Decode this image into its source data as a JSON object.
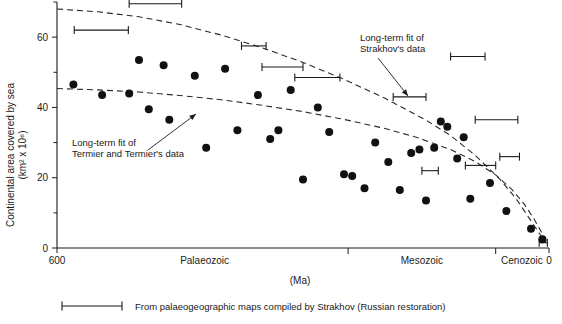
{
  "chart_data": {
    "type": "scatter",
    "title": "",
    "xlabel": "(Ma)",
    "ylabel": "Continental area covered by sea (km² x 10⁶)",
    "ylabel_line1": "Continental area covered by sea",
    "ylabel_line2": "(km² x 10⁶)",
    "xlim": [
      600,
      0
    ],
    "ylim": [
      0,
      70
    ],
    "x_inverted": true,
    "grid": false,
    "legend_position": "below-axis",
    "y_ticks": [
      0,
      20,
      40,
      60
    ],
    "y_tick_labels": [
      "0",
      "20",
      "40",
      "60"
    ],
    "y_minor_ticks": [
      10,
      30,
      50,
      70
    ],
    "x_ticks": [
      600,
      0
    ],
    "x_tick_labels": [
      "600",
      "0"
    ],
    "era_boundaries": [
      245,
      65
    ],
    "era_labels": [
      {
        "name": "Palaeozoic",
        "center_ma": 420
      },
      {
        "name": "Mesozoic",
        "center_ma": 155
      },
      {
        "name": "Cenozoic",
        "center_ma": 33
      }
    ],
    "points": [
      {
        "x": 580,
        "y": 46.5
      },
      {
        "x": 545,
        "y": 43.5
      },
      {
        "x": 512,
        "y": 44.0
      },
      {
        "x": 500,
        "y": 53.5
      },
      {
        "x": 488,
        "y": 39.5
      },
      {
        "x": 470,
        "y": 52.0
      },
      {
        "x": 463,
        "y": 36.5
      },
      {
        "x": 432,
        "y": 49.0
      },
      {
        "x": 418,
        "y": 28.5
      },
      {
        "x": 395,
        "y": 51.0
      },
      {
        "x": 380,
        "y": 33.5
      },
      {
        "x": 355,
        "y": 43.5
      },
      {
        "x": 340,
        "y": 31.0
      },
      {
        "x": 330,
        "y": 33.5
      },
      {
        "x": 315,
        "y": 45.0
      },
      {
        "x": 300,
        "y": 19.5
      },
      {
        "x": 282,
        "y": 40.0
      },
      {
        "x": 268,
        "y": 33.0
      },
      {
        "x": 250,
        "y": 21.0
      },
      {
        "x": 240,
        "y": 20.5
      },
      {
        "x": 225,
        "y": 17.0
      },
      {
        "x": 212,
        "y": 30.0
      },
      {
        "x": 196,
        "y": 24.5
      },
      {
        "x": 182,
        "y": 16.5
      },
      {
        "x": 168,
        "y": 27.0
      },
      {
        "x": 158,
        "y": 28.0
      },
      {
        "x": 150,
        "y": 13.5
      },
      {
        "x": 140,
        "y": 28.5
      },
      {
        "x": 132,
        "y": 36.0
      },
      {
        "x": 124,
        "y": 34.5
      },
      {
        "x": 112,
        "y": 25.5
      },
      {
        "x": 104,
        "y": 31.5
      },
      {
        "x": 96,
        "y": 14.0
      },
      {
        "x": 72,
        "y": 18.5
      },
      {
        "x": 52,
        "y": 10.5
      },
      {
        "x": 22,
        "y": 5.5
      },
      {
        "x": 8,
        "y": 2.5
      }
    ],
    "series": [
      {
        "name": "Long-term fit of Strakhov's data",
        "type": "line",
        "style": "dashed",
        "points": [
          {
            "x": 600,
            "y": 68.0
          },
          {
            "x": 550,
            "y": 67.2
          },
          {
            "x": 500,
            "y": 65.8
          },
          {
            "x": 450,
            "y": 63.6
          },
          {
            "x": 400,
            "y": 60.6
          },
          {
            "x": 350,
            "y": 57.0
          },
          {
            "x": 300,
            "y": 52.8
          },
          {
            "x": 250,
            "y": 48.0
          },
          {
            "x": 200,
            "y": 42.6
          },
          {
            "x": 150,
            "y": 36.4
          },
          {
            "x": 120,
            "y": 32.0
          },
          {
            "x": 90,
            "y": 26.4
          },
          {
            "x": 60,
            "y": 19.6
          },
          {
            "x": 40,
            "y": 14.0
          },
          {
            "x": 25,
            "y": 8.8
          },
          {
            "x": 12,
            "y": 4.2
          },
          {
            "x": 4,
            "y": 1.6
          }
        ]
      },
      {
        "name": "Long-term fit of Termier and Termier's data",
        "type": "line",
        "style": "dashed",
        "points": [
          {
            "x": 600,
            "y": 45.4
          },
          {
            "x": 550,
            "y": 45.0
          },
          {
            "x": 500,
            "y": 44.4
          },
          {
            "x": 450,
            "y": 43.4
          },
          {
            "x": 400,
            "y": 42.2
          },
          {
            "x": 350,
            "y": 40.6
          },
          {
            "x": 300,
            "y": 38.8
          },
          {
            "x": 250,
            "y": 36.6
          },
          {
            "x": 200,
            "y": 34.0
          },
          {
            "x": 160,
            "y": 31.4
          },
          {
            "x": 120,
            "y": 28.0
          },
          {
            "x": 90,
            "y": 24.6
          },
          {
            "x": 65,
            "y": 20.8
          },
          {
            "x": 45,
            "y": 16.6
          },
          {
            "x": 30,
            "y": 12.4
          },
          {
            "x": 18,
            "y": 8.2
          },
          {
            "x": 8,
            "y": 4.0
          },
          {
            "x": 2,
            "y": 1.2
          }
        ]
      }
    ],
    "error_bars": [
      {
        "x_start": 512,
        "x_end": 448,
        "y": 69.5
      },
      {
        "x_start": 579,
        "x_end": 513,
        "y": 62.0
      },
      {
        "x_start": 375,
        "x_end": 345,
        "y": 57.5
      },
      {
        "x_start": 350,
        "x_end": 300,
        "y": 51.5
      },
      {
        "x_start": 310,
        "x_end": 255,
        "y": 48.5
      },
      {
        "x_start": 190,
        "x_end": 150,
        "y": 43.0
      },
      {
        "x_start": 120,
        "x_end": 78,
        "y": 54.5
      },
      {
        "x_start": 90,
        "x_end": 38,
        "y": 36.5
      },
      {
        "x_start": 155,
        "x_end": 135,
        "y": 22.0
      },
      {
        "x_start": 102,
        "x_end": 65,
        "y": 23.5
      },
      {
        "x_start": 60,
        "x_end": 36,
        "y": 26.0
      },
      {
        "x_start": 12,
        "x_end": 2,
        "y": 1.5
      }
    ],
    "annotations": [
      {
        "name": "strakhov-fit-annotation",
        "line1": "Long-term fit of",
        "line2": "Strakhov's data",
        "text_x": 360,
        "text_y": 41,
        "arrow_from_x": 378,
        "arrow_from_y": 58,
        "arrow_to_x": 408,
        "arrow_to_y": 96
      },
      {
        "name": "termier-fit-annotation",
        "line1": "Long-term fit of",
        "line2": "Termier and Termier's data",
        "text_x": 72,
        "text_y": 146,
        "arrow_from_x": 148,
        "arrow_from_y": 150,
        "arrow_to_x": 196,
        "arrow_to_y": 114
      }
    ],
    "legend": {
      "marker": "horizontal-error-bar",
      "text": "From palaeogeographic maps compiled by Strakhov (Russian restoration)"
    }
  }
}
